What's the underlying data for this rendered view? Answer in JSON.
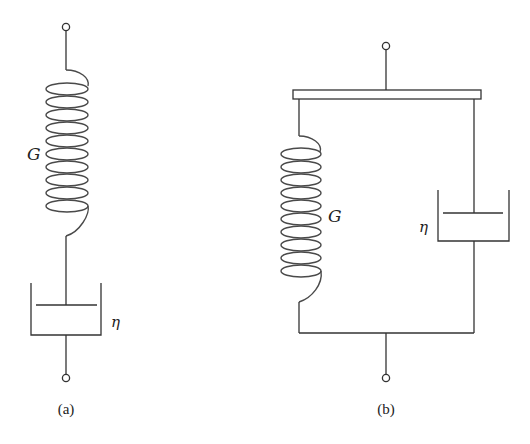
{
  "figure": {
    "type": "viscoelastic mechanical models",
    "panels": [
      {
        "id": "a",
        "caption": "(a)",
        "arrangement": "series",
        "model_name_hint": "spring and dashpot in series",
        "elements": [
          {
            "kind": "spring",
            "label": "G",
            "coils": 10
          },
          {
            "kind": "dashpot",
            "label": "η"
          }
        ],
        "terminals": 2
      },
      {
        "id": "b",
        "caption": "(b)",
        "arrangement": "parallel",
        "model_name_hint": "spring and dashpot in parallel",
        "elements": [
          {
            "kind": "spring",
            "label": "G",
            "coils": 10
          },
          {
            "kind": "dashpot",
            "label": "η"
          }
        ],
        "terminals": 2
      }
    ]
  },
  "labels": {
    "a_spring": "G",
    "a_dashpot": "η",
    "a_caption": "(a)",
    "b_spring": "G",
    "b_dashpot": "η",
    "b_caption": "(b)"
  },
  "colors": {
    "line": "#333333",
    "background": "#ffffff"
  }
}
